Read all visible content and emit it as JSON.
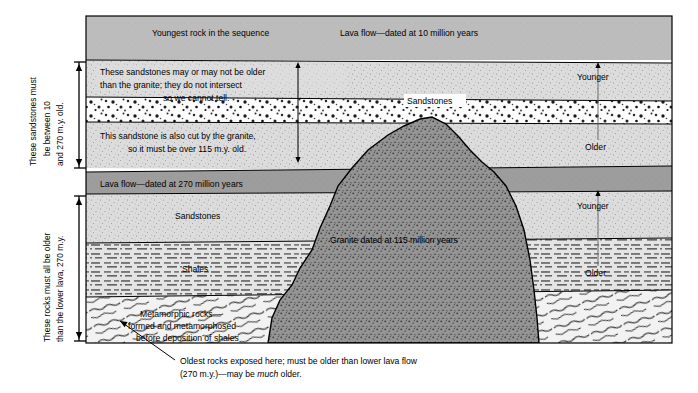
{
  "figure": {
    "type": "geologic-cross-section",
    "title_visible": false
  },
  "top_band": {
    "left_label": "Youngest rock in the sequence",
    "right_label": "Lava flow—dated at 10 million years"
  },
  "upper_sandstone": {
    "line1": "These sandstones may or may not be older",
    "line2": "than the granite; they do not intersect",
    "line3": "so we cannot tell."
  },
  "conglomerate": {
    "label": "Sandstones"
  },
  "mid_sandstone": {
    "line1": "This sandstone is also cut by the granite,",
    "line2": "so it must be over 115 m.y. old."
  },
  "lower_lava": {
    "label": "Lava flow—dated at 270 million years"
  },
  "lower_sandstone": {
    "label": "Sandstones"
  },
  "shales": {
    "label": "Shales"
  },
  "metamorphic": {
    "line1": "Metamorphic rocks—",
    "line2": "formed and metamorphosed",
    "line3": "before deposition of shales"
  },
  "granite": {
    "label": "Granite dated at 115 million years"
  },
  "age_arrows": {
    "upper": {
      "younger": "Younger",
      "older": "Older"
    },
    "lower": {
      "younger": "Younger",
      "older": "Older"
    }
  },
  "left_brackets": {
    "upper": {
      "line1": "These sandstones must",
      "line2": "be  between  10",
      "line3": "and 270 m.y. old."
    },
    "lower": {
      "line1": "These rocks must all be older",
      "line2": "than the lower lava, 270 m.y."
    }
  },
  "caption": {
    "line1_a": "Oldest rocks exposed here; must be older than lower lava flow",
    "line2_a": "(270 m.y.)—may be ",
    "line2_em": "much",
    "line2_b": " older."
  },
  "colors": {
    "top_band": "#b9b9b9",
    "lava_band": "#9a9a9a",
    "sandstone": "#d8d8d8",
    "conglomerate": "#fbfbfb",
    "shale": "#e2e2e2",
    "metamorphic": "#f0f0f0",
    "granite": "#8f8f8f",
    "outline": "#000000"
  }
}
